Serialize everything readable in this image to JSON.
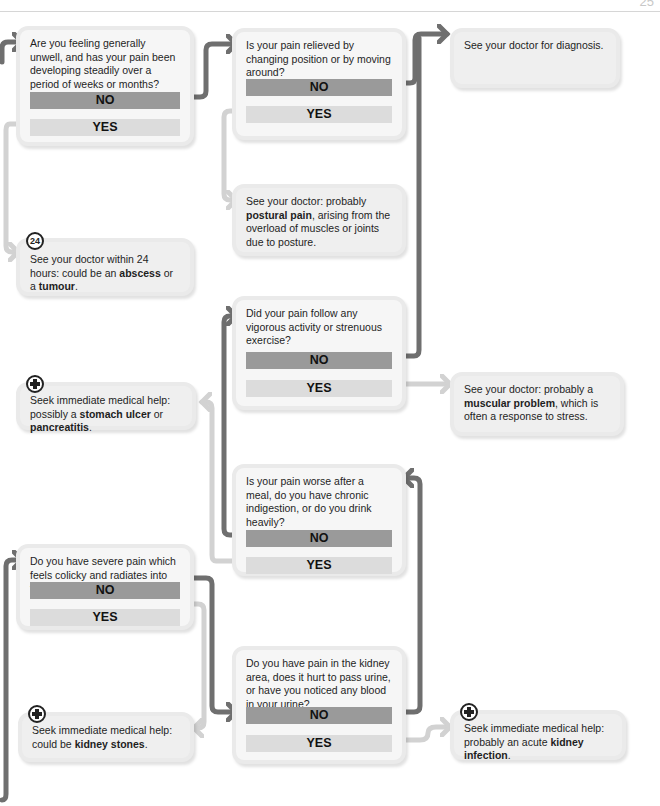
{
  "page": {
    "number": "25"
  },
  "colors": {
    "no_button": "#9a9a9a",
    "yes_button": "#dcdcdc",
    "no_connector": "#6f6f6f",
    "yes_connector": "#d2d2d2",
    "box_bg": "#f6f6f6"
  },
  "nodes": {
    "q_unwell": {
      "question": "Are you feeling generally unwell, and has your pain been developing steadily over a period of weeks or months?",
      "no": "NO",
      "yes": "YES"
    },
    "q_relieved": {
      "question": "Is your pain relieved by changing position or by moving around?",
      "no": "NO",
      "yes": "YES"
    },
    "r_diagnosis": {
      "text": "See your doctor for diagnosis."
    },
    "r_postural": {
      "pre": "See your doctor: probably ",
      "bold": "postural pain",
      "post": ", arising from the overload of muscles or joints due to posture."
    },
    "r_abscess": {
      "badge": "24",
      "pre": "See your doctor within 24 hours: could be an ",
      "bold1": "abscess",
      "mid": " or a ",
      "bold2": "tumour",
      "post": "."
    },
    "q_vigorous": {
      "question": "Did your pain follow any vigorous activity or strenuous exercise?",
      "no": "NO",
      "yes": "YES"
    },
    "r_muscular": {
      "pre": "See your doctor: probably a ",
      "bold": "muscular problem",
      "post": ", which is often a response to stress."
    },
    "r_ulcer": {
      "pre": "Seek immediate medical help: possibly a ",
      "bold1": "stomach ulcer",
      "mid": " or ",
      "bold2": "pancreatitis",
      "post": "."
    },
    "q_meal": {
      "question": "Is your pain worse after a meal, do you have chronic indigestion, or do you drink heavily?",
      "no": "NO",
      "yes": "YES"
    },
    "q_colicky": {
      "question": "Do you have severe pain which feels colicky and radiates into the groin area?",
      "no": "NO",
      "yes": "YES"
    },
    "q_kidney": {
      "question": "Do you have pain in the kidney area, does it hurt to pass urine, or have you noticed any blood in your urine?",
      "no": "NO",
      "yes": "YES"
    },
    "r_stones": {
      "pre": "Seek immediate medical help: could be ",
      "bold": "kidney stones",
      "post": "."
    },
    "r_infection": {
      "pre": "Seek immediate medical help: probably an acute ",
      "bold": "kidney infection",
      "post": "."
    }
  }
}
